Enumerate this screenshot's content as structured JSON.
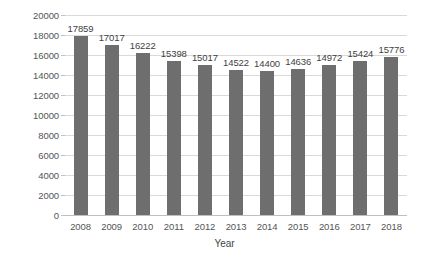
{
  "chart_data": {
    "type": "bar",
    "title": "",
    "subtitle": "",
    "xlabel": "Year",
    "ylabel": "Number of concerts",
    "categories": [
      "2008",
      "2009",
      "2010",
      "2011",
      "2012",
      "2013",
      "2014",
      "2015",
      "2016",
      "2017",
      "2018"
    ],
    "values": [
      17859,
      17017,
      16222,
      15398,
      15017,
      14522,
      14400,
      14636,
      14972,
      15424,
      15776
    ],
    "data_labels": [
      "17859",
      "17017",
      "16222",
      "15398",
      "15017",
      "14522",
      "14400",
      "14636",
      "14972",
      "15424",
      "15776"
    ],
    "ylim": [
      0,
      20000
    ],
    "ytick_values": [
      0,
      2000,
      4000,
      6000,
      8000,
      10000,
      12000,
      14000,
      16000,
      18000,
      20000
    ],
    "ytick_labels": [
      "0",
      "2000",
      "4000",
      "6000",
      "8000",
      "10000",
      "12000",
      "14000",
      "16000",
      "18000",
      "20000"
    ],
    "grid": "horizontal",
    "legend": "none",
    "bar_color": "#6e6e6e",
    "gridline_color": "#d9d9d9",
    "background_color": "#ffffff",
    "label_text_color": "#3f3f3f",
    "axis_text_color": "#555555"
  }
}
